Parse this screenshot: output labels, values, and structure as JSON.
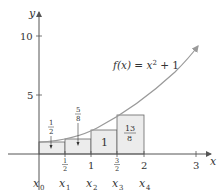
{
  "figure": {
    "function_label": "f(x) = x² + 1",
    "function_label_parts": {
      "fx": "f(x) = x",
      "exp": "2",
      "rest": " + 1"
    },
    "axis_x_label": "x",
    "axis_y_label": "y",
    "y_ticks": [
      {
        "label": "10",
        "value": 10
      },
      {
        "label": "5",
        "value": 5
      }
    ],
    "x_ticks": [
      {
        "label": "1/2",
        "num": "1",
        "den": "2",
        "value": 0.5
      },
      {
        "label": "1",
        "value": 1
      },
      {
        "label": "3/2",
        "num": "3",
        "den": "2",
        "value": 1.5
      },
      {
        "label": "2",
        "value": 2
      },
      {
        "label": "3",
        "value": 3
      }
    ],
    "partition_labels": [
      {
        "main": "x",
        "sub": "0"
      },
      {
        "main": "x",
        "sub": "1"
      },
      {
        "main": "x",
        "sub": "2"
      },
      {
        "main": "x",
        "sub": "3"
      },
      {
        "main": "x",
        "sub": "4"
      }
    ],
    "rectangles": [
      {
        "x_left": 0,
        "x_right": 0.5,
        "height": 1,
        "area_label": "1/2",
        "num": "1",
        "den": "2"
      },
      {
        "x_left": 0.5,
        "x_right": 1,
        "height": 1.25,
        "area_label": "5/8",
        "num": "5",
        "den": "8"
      },
      {
        "x_left": 1,
        "x_right": 1.5,
        "height": 2,
        "area_label": "1"
      },
      {
        "x_left": 1.5,
        "x_right": 2,
        "height": 3.25,
        "area_label": "13/8",
        "num": "13",
        "den": "8"
      }
    ],
    "colors": {
      "axis": "#555555",
      "curve": "#9a9a9a",
      "rect_fill": "#ececec",
      "rect_stroke": "#666666",
      "text": "#333333"
    }
  }
}
